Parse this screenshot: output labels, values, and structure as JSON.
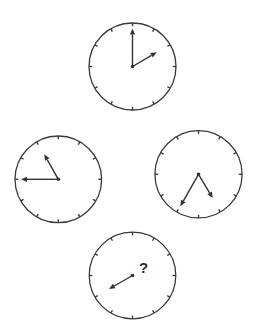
{
  "puzzle": {
    "type": "clock-sequence",
    "question_mark": "?",
    "clocks": [
      {
        "id": "top",
        "cx": 132.5,
        "cy": 66.5,
        "r": 43.5,
        "time": "2:00",
        "hour_tip": [
          156.7,
          52.3
        ],
        "minute_tip": [
          132.5,
          28.5
        ],
        "has_minute_hand": true,
        "has_hour_hand": true
      },
      {
        "id": "left",
        "cx": 58.3,
        "cy": 179.3,
        "r": 43.3,
        "time": "10:45",
        "hour_tip": [
          44.3,
          154.3
        ],
        "minute_tip": [
          21.0,
          179.3
        ],
        "has_minute_hand": true,
        "has_hour_hand": true
      },
      {
        "id": "right",
        "cx": 198.5,
        "cy": 174.3,
        "r": 43.6,
        "time": "5:35",
        "hour_tip": [
          212.7,
          198.0
        ],
        "minute_tip": [
          180.3,
          206.3
        ],
        "has_minute_hand": true,
        "has_hour_hand": true
      },
      {
        "id": "bottom",
        "cx": 132.5,
        "cy": 275.5,
        "r": 43.3,
        "time": "?",
        "hour_tip": null,
        "minute_tip": [
          109.0,
          289.0
        ],
        "has_minute_hand": true,
        "has_hour_hand": false
      }
    ]
  },
  "colors": {
    "stroke": "#3a3a3a",
    "hand": "#333333",
    "background": "#ffffff"
  }
}
